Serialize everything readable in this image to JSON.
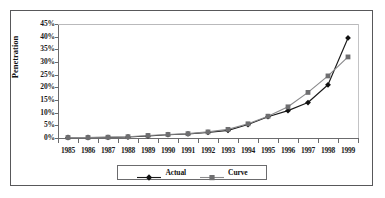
{
  "chart_data": {
    "type": "line",
    "title": "",
    "xlabel": "",
    "ylabel": "Penetration",
    "ylim": [
      0,
      45
    ],
    "ytick_labels": [
      "45%",
      "40%",
      "35%",
      "30%",
      "25%",
      "20%",
      "15%",
      "10%",
      "5%",
      "0%"
    ],
    "ytick_values": [
      45,
      40,
      35,
      30,
      25,
      20,
      15,
      10,
      5,
      0
    ],
    "grid": false,
    "legend_position": "bottom-center",
    "categories": [
      "1985",
      "1986",
      "1987",
      "1988",
      "1989",
      "1990",
      "1991",
      "1992",
      "1993",
      "1994",
      "1995",
      "1996",
      "1997",
      "1998",
      "1999"
    ],
    "series": [
      {
        "name": "Actual",
        "marker": "diamond",
        "color": "#1a1a1a",
        "values": [
          0.2,
          0.2,
          0.25,
          0.4,
          0.8,
          1.3,
          1.6,
          2.2,
          3.0,
          5.3,
          8.4,
          10.8,
          14.0,
          21.0,
          39.5
        ]
      },
      {
        "name": "Curve",
        "marker": "square",
        "color": "#8a8a8c",
        "values": [
          0.2,
          0.2,
          0.3,
          0.5,
          1.0,
          1.4,
          1.7,
          2.4,
          3.4,
          5.6,
          8.6,
          12.3,
          18.0,
          24.5,
          32.0
        ]
      }
    ]
  },
  "legend": {
    "entries": [
      {
        "label": "Actual"
      },
      {
        "label": "Curve"
      }
    ]
  }
}
